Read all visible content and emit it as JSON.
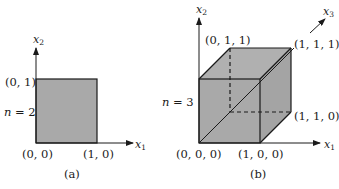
{
  "colors": {
    "fill": "#a9a9a9",
    "fill_back": "#b4b4b4",
    "stroke": "#1a1a1a",
    "background": "#ffffff"
  },
  "panel_a": {
    "caption": "(a)",
    "n_label": {
      "var": "n",
      "eq": " = 2"
    },
    "axis_x1": {
      "base": "x",
      "sub": "1"
    },
    "axis_x2": {
      "base": "x",
      "sub": "2"
    },
    "vertices": {
      "v00": "(0, 0)",
      "v10": "(1, 0)",
      "v01": "(0, 1)"
    }
  },
  "panel_b": {
    "caption": "(b)",
    "n_label": {
      "var": "n",
      "eq": " = 3"
    },
    "axis_x1": {
      "base": "x",
      "sub": "1"
    },
    "axis_x2": {
      "base": "x",
      "sub": "2"
    },
    "axis_x3": {
      "base": "x",
      "sub": "3"
    },
    "vertices": {
      "v000": "(0, 0, 0)",
      "v100": "(1, 0, 0)",
      "v011": "(0, 1, 1)",
      "v111": "(1, 1, 1)",
      "v110": "(1, 1, 0)"
    }
  }
}
